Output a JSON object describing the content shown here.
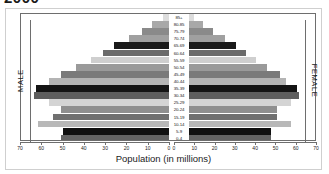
{
  "title": "2000",
  "axis_title": "Population (in millions)",
  "male_caption": "MALE",
  "female_caption": "FEMALE",
  "colors": {
    "frame": "#6e6e6e",
    "plate_border": "#cfcfcf",
    "background": "#ffffff",
    "text": "#1c1c1c"
  },
  "chart_data": {
    "type": "bar",
    "subtype": "population-pyramid",
    "title": "2000",
    "xlabel": "Population (in millions)",
    "ylabel": "",
    "orientation": "horizontal",
    "grid": false,
    "legend": null,
    "left_panel_label": "MALE",
    "right_panel_label": "FEMALE",
    "xlim_left": [
      70,
      0
    ],
    "xlim_right": [
      0,
      70
    ],
    "xticks_left": [
      70,
      60,
      50,
      40,
      30,
      20,
      10,
      0
    ],
    "xticks_right": [
      0,
      10,
      20,
      30,
      40,
      50,
      60,
      70
    ],
    "categories": [
      "85+",
      "80-85",
      "75-79",
      "70-74",
      "65-69",
      "60-64",
      "55-59",
      "50-54",
      "45-49",
      "40-44",
      "35-39",
      "30-34",
      "25-29",
      "20-24",
      "15-19",
      "10-14",
      "5-9",
      "0-4"
    ],
    "series": [
      {
        "name": "MALE",
        "side": "left",
        "values": [
          3,
          8,
          13,
          19,
          26,
          31,
          37,
          44,
          51,
          57,
          63,
          64,
          57,
          51,
          55,
          62,
          50,
          51
        ]
      },
      {
        "name": "FEMALE",
        "side": "right",
        "values": [
          4,
          9,
          14,
          21,
          27,
          32,
          38,
          44,
          51,
          54,
          60,
          61,
          57,
          49,
          49,
          57,
          46,
          46
        ]
      }
    ],
    "bar_shades": [
      "#dcdcdc",
      "#a8a8a8",
      "#8a8a8a",
      "#a0a0a0",
      "#1a1a1a",
      "#6b6b6b",
      "#cfcfcf",
      "#9a9a9a",
      "#7a7a7a",
      "#b4b4b4",
      "#141414",
      "#5e5e5e",
      "#d4d4d4",
      "#8f8f8f",
      "#707070",
      "#b8b8b8",
      "#101010",
      "#636363"
    ]
  }
}
